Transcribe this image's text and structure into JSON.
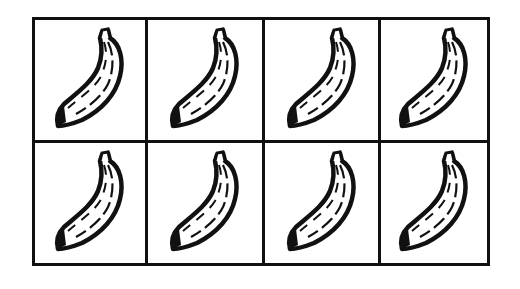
{
  "figure": {
    "type": "picture-grid",
    "rows": 2,
    "columns": 4,
    "item_icon": "banana-icon",
    "item_count": 8,
    "line_color": "#111111",
    "background": "#ffffff"
  },
  "cells": [
    {
      "row": 1,
      "col": 1,
      "icon": "banana-icon"
    },
    {
      "row": 1,
      "col": 2,
      "icon": "banana-icon"
    },
    {
      "row": 1,
      "col": 3,
      "icon": "banana-icon"
    },
    {
      "row": 1,
      "col": 4,
      "icon": "banana-icon"
    },
    {
      "row": 2,
      "col": 1,
      "icon": "banana-icon"
    },
    {
      "row": 2,
      "col": 2,
      "icon": "banana-icon"
    },
    {
      "row": 2,
      "col": 3,
      "icon": "banana-icon"
    },
    {
      "row": 2,
      "col": 4,
      "icon": "banana-icon"
    }
  ]
}
